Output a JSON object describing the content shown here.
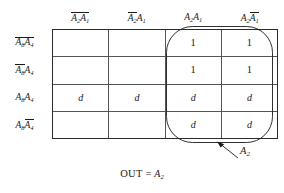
{
  "figure": {
    "type": "karnaugh-map",
    "caption": "OUT = A2"
  },
  "columns": [
    {
      "id": "col-0",
      "text": "A̅2A̅1",
      "base": "A2A1",
      "bars": [
        true,
        true
      ]
    },
    {
      "id": "col-1",
      "text": "A̅2A1",
      "base": "A2A1",
      "bars": [
        true,
        false
      ]
    },
    {
      "id": "col-2",
      "text": "A2A1",
      "base": "A2A1",
      "bars": [
        false,
        false
      ]
    },
    {
      "id": "col-3",
      "text": "A2A̅1",
      "base": "A2A1",
      "bars": [
        false,
        true
      ]
    }
  ],
  "rows": [
    {
      "id": "row-0",
      "text": "A̅8A̅4",
      "base": "A8A4",
      "bars": [
        true,
        true
      ]
    },
    {
      "id": "row-1",
      "text": "A̅8A4",
      "base": "A8A4",
      "bars": [
        true,
        false
      ]
    },
    {
      "id": "row-2",
      "text": "A8A4",
      "base": "A8A4",
      "bars": [
        false,
        false
      ]
    },
    {
      "id": "row-3",
      "text": "A8A̅4",
      "base": "A8A4",
      "bars": [
        false,
        true
      ]
    }
  ],
  "cells": [
    [
      "",
      "",
      "1",
      "1"
    ],
    [
      "",
      "",
      "1",
      "1"
    ],
    [
      "d",
      "d",
      "d",
      "d"
    ],
    [
      "",
      "",
      "d",
      "d"
    ]
  ],
  "group": {
    "label_main": "A",
    "label_sub": "2",
    "covers_columns": [
      2,
      3
    ],
    "covers_rows": [
      0,
      1,
      2,
      3
    ]
  },
  "equation": {
    "lhs": "OUT",
    "operator": "=",
    "rhs_main": "A",
    "rhs_sub": "2"
  },
  "colors": {
    "ink": "#1a1a1a",
    "grid_outer": "#2b2b2b",
    "grid_inner": "#555555",
    "background": "#ffffff"
  }
}
